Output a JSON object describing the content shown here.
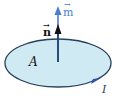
{
  "diagram": {
    "labels": {
      "normal_vector": "n",
      "moment_vector": "m",
      "area": "A",
      "current": "I"
    },
    "colors": {
      "loop_fill": "#cfeaf2",
      "loop_stroke": "#2a3f5a",
      "normal_arrow": "#111111",
      "moment_arrow": "#4a7fd0",
      "current_arrow": "#2a4fb0",
      "moment_label": "#4a7fd0"
    }
  }
}
